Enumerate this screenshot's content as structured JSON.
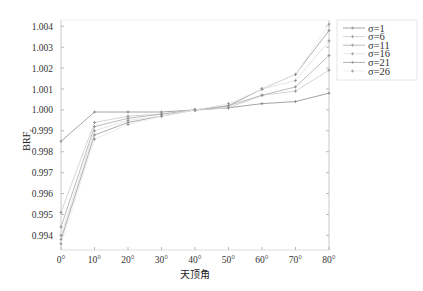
{
  "chart_data": {
    "type": "line",
    "title": "",
    "xlabel": "天顶角",
    "ylabel": "BRF",
    "ylabel_subscript": "r",
    "x": [
      0,
      10,
      20,
      30,
      40,
      50,
      60,
      70,
      80
    ],
    "x_tick_labels": [
      "0°",
      "10°",
      "20°",
      "30°",
      "40°",
      "50°",
      "60°",
      "70°",
      "80°"
    ],
    "xlim": [
      0,
      80
    ],
    "ylim": [
      0.9933,
      1.0043
    ],
    "y_ticks": [
      0.994,
      0.995,
      0.996,
      0.997,
      0.998,
      0.999,
      1.0,
      1.001,
      1.002,
      1.003,
      1.004
    ],
    "y_tick_labels": [
      "0.994",
      "0.995",
      "0.996",
      "0.997",
      "0.998",
      "0.999",
      "1.000",
      "1.001",
      "1.002",
      "1.003",
      "1.004"
    ],
    "grid": false,
    "legend_position": "upper right, outside plot",
    "series": [
      {
        "name": "σ=1",
        "values": [
          0.9985,
          0.9999,
          0.9999,
          0.9999,
          1.0,
          1.0001,
          1.0003,
          1.0004,
          1.0008
        ]
      },
      {
        "name": "σ=6",
        "values": [
          0.9951,
          0.9994,
          0.9997,
          0.9998,
          1.0,
          1.0001,
          1.0007,
          1.0009,
          1.0019
        ]
      },
      {
        "name": "σ=11",
        "values": [
          0.9944,
          0.9992,
          0.9996,
          0.9998,
          1.0,
          1.0002,
          1.0007,
          1.0011,
          1.0026
        ]
      },
      {
        "name": "σ=16",
        "values": [
          0.994,
          0.999,
          0.9995,
          0.9997,
          1.0,
          1.0002,
          1.001,
          1.0014,
          1.0033
        ]
      },
      {
        "name": "σ=21",
        "values": [
          0.9938,
          0.9988,
          0.9994,
          0.9997,
          1.0,
          1.0002,
          1.001,
          1.0017,
          1.0038
        ]
      },
      {
        "name": "σ=26",
        "values": [
          0.9936,
          0.9986,
          0.9993,
          0.9997,
          1.0,
          1.0003,
          1.001,
          1.0017,
          1.0041
        ]
      }
    ],
    "colors": [
      "#9a9a9a",
      "#d0d0d0",
      "#b4b4b4",
      "#e2e2e2",
      "#a6a6a6",
      "#ececec"
    ]
  },
  "legend": {
    "items": [
      "σ=1",
      "σ=6",
      "σ=11",
      "σ=16",
      "σ=21",
      "σ=26"
    ]
  },
  "axes": {
    "xlabel": "天顶角",
    "ylabel": "BRF",
    "ylabel_sub": "r"
  }
}
